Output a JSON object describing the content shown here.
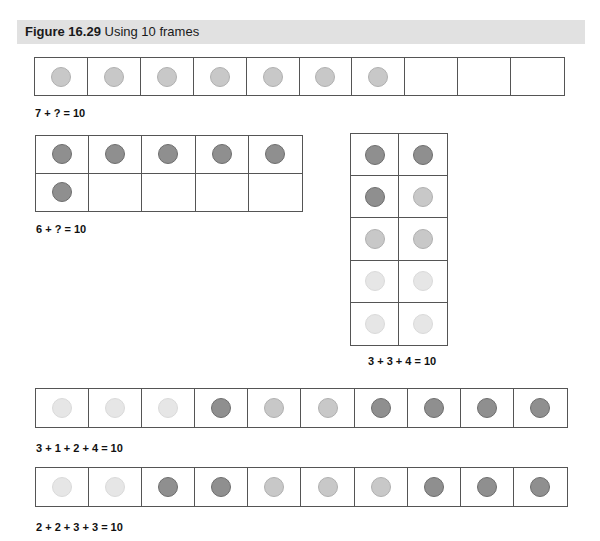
{
  "header": {
    "figure_number": "Figure 16.29",
    "title": "Using 10 frames"
  },
  "colors": {
    "banner": "#e1e1e1",
    "dot_light": "#e6e6e6",
    "dot_medium": "#c8c8c8",
    "dot_dark": "#8f8f8f",
    "grid_line": "#555555"
  },
  "frames": [
    {
      "id": "frame-7-plus",
      "layout": "1x10",
      "cells": [
        "medium",
        "medium",
        "medium",
        "medium",
        "medium",
        "medium",
        "medium",
        "empty",
        "empty",
        "empty"
      ],
      "equation": "7 + ? = 10"
    },
    {
      "id": "frame-6-plus",
      "layout": "2x5",
      "cells": [
        "dark",
        "dark",
        "dark",
        "dark",
        "dark",
        "dark",
        "empty",
        "empty",
        "empty",
        "empty"
      ],
      "equation": "6 + ? = 10"
    },
    {
      "id": "frame-3-3-4",
      "layout": "5x2",
      "cells": [
        "dark",
        "dark",
        "dark",
        "medium",
        "medium",
        "medium",
        "light",
        "light",
        "light",
        "light"
      ],
      "equation": "3 + 3 + 4 = 10"
    },
    {
      "id": "frame-3-1-2-4",
      "layout": "1x10",
      "cells": [
        "light",
        "light",
        "light",
        "dark",
        "medium",
        "medium",
        "dark",
        "dark",
        "dark",
        "dark"
      ],
      "equation": "3 + 1 + 2 + 4 = 10"
    },
    {
      "id": "frame-2-2-3-3",
      "layout": "1x10",
      "cells": [
        "light",
        "light",
        "dark",
        "dark",
        "medium",
        "medium",
        "medium",
        "dark",
        "dark",
        "dark"
      ],
      "equation": "2 + 2 + 3 + 3 = 10"
    }
  ]
}
